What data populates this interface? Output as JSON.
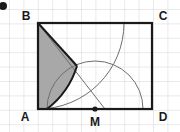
{
  "figure": {
    "background": "#ffffff",
    "grid": {
      "visible": true,
      "cell_size": 14.4,
      "line_color": "#d0d0d0",
      "origin_x": 9,
      "origin_y": 9
    },
    "colors": {
      "outline": "#1a1a1a",
      "shaded_fill": "#a8a8a8",
      "arc_thin": "#6e6e6e",
      "label": "#1a1a1a",
      "corner_mark": "#1a1a1a"
    },
    "rectangle": {
      "name": "ABCD",
      "left": 38,
      "top": 23,
      "right": 152,
      "bottom": 109,
      "stroke_width": 2.2
    },
    "points": {
      "A": {
        "x": 38,
        "y": 109,
        "label": "A",
        "label_x": 25,
        "label_y": 120
      },
      "B": {
        "x": 38,
        "y": 23,
        "label": "B",
        "label_x": 25,
        "label_y": 19
      },
      "C": {
        "x": 152,
        "y": 23,
        "label": "C",
        "label_x": 159,
        "label_y": 19
      },
      "D": {
        "x": 152,
        "y": 109,
        "label": "D",
        "label_x": 159,
        "label_y": 120
      },
      "M": {
        "x": 95,
        "y": 109,
        "label": "M",
        "label_x": 95,
        "label_y": 126,
        "dot_radius": 2.6
      }
    },
    "arcs": [
      {
        "name": "arc-centered-at-A",
        "center": "A",
        "cx": 38,
        "cy": 109,
        "radius": 86,
        "from_x": 38,
        "from_y": 23,
        "to_x": 124,
        "to_y": 109,
        "stroke": "#1a1a1a",
        "stroke_width": 2.0,
        "note": "quarter circle radius AB, only lower-left portion drawn bold"
      },
      {
        "name": "arc-centered-at-B",
        "center": "B",
        "cx": 38,
        "cy": 23,
        "radius": 86,
        "from_x": 124,
        "from_y": 23,
        "to_x": 38,
        "to_y": 109,
        "stroke": "#6e6e6e",
        "stroke_width": 1.0
      },
      {
        "name": "arc-centered-at-M",
        "center": "M",
        "cx": 95,
        "cy": 109,
        "radius": 48,
        "from_x": 47,
        "from_y": 109,
        "to_x": 143,
        "to_y": 109,
        "stroke": "#6e6e6e",
        "stroke_width": 1.0
      }
    ],
    "segments": [
      {
        "name": "segment-B-to-M-arc-foot",
        "x1": 38,
        "y1": 23,
        "x2": 105,
        "y2": 109,
        "stroke": "#6e6e6e",
        "stroke_width": 1.0
      },
      {
        "name": "segment-B-to-shade-corner",
        "x1": 38,
        "y1": 23,
        "x2": 77,
        "y2": 66,
        "stroke": "#1a1a1a",
        "stroke_width": 2.0
      }
    ],
    "shaded_region": {
      "name": "shaded-lune",
      "fill": "#a8a8a8",
      "description": "region bounded by side AB, straight chord from B, and the arc centered at A back down to AD"
    },
    "corner_mark": {
      "name": "top-left-corner-mark",
      "x": 3,
      "y": 5,
      "radius": 4
    }
  }
}
